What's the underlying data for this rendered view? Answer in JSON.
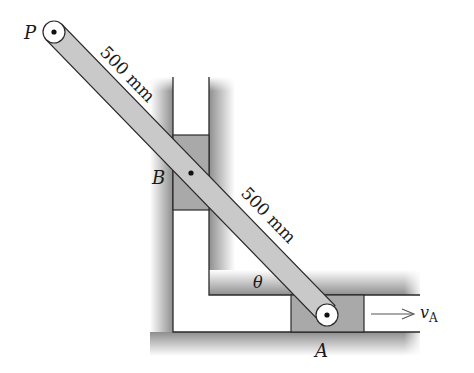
{
  "diagram": {
    "type": "mechanism",
    "labels": {
      "point_p": "P",
      "point_b": "B",
      "point_a": "A",
      "angle": "θ",
      "velocity_main": "v",
      "velocity_sub": "A"
    },
    "dimensions": {
      "pb": "500 mm",
      "ba": "500 mm"
    },
    "colors": {
      "bar_fill": "#c9c9c9",
      "block_fill": "#a9a9a9",
      "wall_shade": "#9a9a9a",
      "outline": "#2a2a2a",
      "background": "#ffffff"
    }
  }
}
